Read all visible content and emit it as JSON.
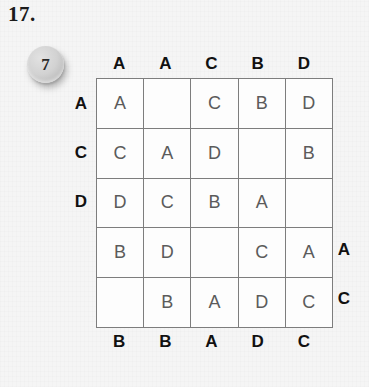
{
  "problem": {
    "number_label": "17."
  },
  "score_token": {
    "value": "7",
    "name": "score-token"
  },
  "grid": {
    "rows": 5,
    "columns": 5,
    "cells": [
      [
        "A",
        "",
        "C",
        "B",
        "D"
      ],
      [
        "C",
        "A",
        "D",
        "",
        "B"
      ],
      [
        "D",
        "C",
        "B",
        "A",
        ""
      ],
      [
        "B",
        "D",
        "",
        "C",
        "A"
      ],
      [
        "",
        "B",
        "A",
        "D",
        "C"
      ]
    ]
  },
  "clues": {
    "top": [
      "A",
      "A",
      "C",
      "B",
      "D"
    ],
    "bottom": [
      "B",
      "B",
      "A",
      "D",
      "C"
    ],
    "left": [
      "A",
      "C",
      "D",
      "",
      ""
    ],
    "right": [
      "",
      "",
      "",
      "A",
      "C"
    ]
  },
  "colors": {
    "background": "#f5f5f5",
    "grid_line": "#7d7d7d",
    "cell_fill": "#fdfdfd",
    "cell_text": "#5b5b5b",
    "clue_text": "#111111",
    "token_face": "#d2d2d2"
  }
}
